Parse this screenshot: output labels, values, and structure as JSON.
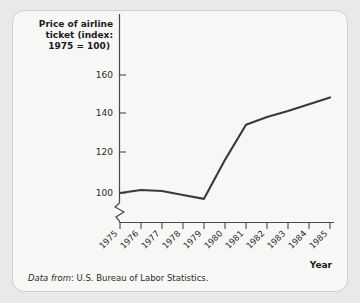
{
  "card": {
    "background": "#f7f7f5",
    "border_color": "#cfcfcb"
  },
  "source_note": {
    "prefix": "Data from",
    "text": ": U.S. Bureau of Labor Statistics."
  },
  "chart_data": {
    "type": "line",
    "title": "Price of airline ticket (index: 1975 = 100)",
    "title_lines": [
      "Price of airline",
      "ticket (index:",
      "1975 = 100)"
    ],
    "xlabel": "Year",
    "ylabel": "",
    "categories": [
      "1975",
      "1976",
      "1977",
      "1978",
      "1979",
      "1980",
      "1981",
      "1982",
      "1983",
      "1984",
      "1985"
    ],
    "values": [
      100,
      101.5,
      101,
      99,
      97,
      117,
      135,
      139,
      142,
      145.5,
      149
    ],
    "series": [
      {
        "name": "Price of airline ticket (index: 1975 = 100)",
        "values": [
          100,
          101.5,
          101,
          99,
          97,
          117,
          135,
          139,
          142,
          145.5,
          149
        ]
      }
    ],
    "yticks": [
      100,
      120,
      140,
      160
    ],
    "ytick_labels": [
      "100",
      "120",
      "140",
      "160"
    ],
    "ylim": [
      97,
      165
    ],
    "axis_break": true,
    "grid": false,
    "legend": "none",
    "line_color": "#3a3a3a",
    "axis_color": "#4a4a4a"
  }
}
